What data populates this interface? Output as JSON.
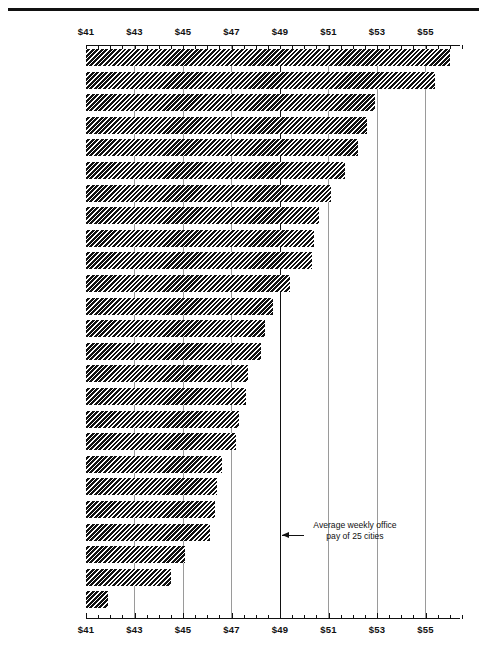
{
  "chart_data": {
    "type": "bar",
    "orientation": "horizontal",
    "title": "",
    "xlabel": "",
    "ylabel": "",
    "xlim": [
      41,
      56.5
    ],
    "grid": true,
    "tick_labels": [
      "$41",
      "$43",
      "$45",
      "$47",
      "$49",
      "$51",
      "$53",
      "$55"
    ],
    "tick_values": [
      41,
      43,
      45,
      47,
      49,
      51,
      53,
      55
    ],
    "categories": [
      "San Francisco",
      "Los Angeles",
      "New York City",
      "Cleveland",
      "Seattle",
      "Houston",
      "Pittsburgh",
      "Newark",
      "Indianapolis",
      "Rochester",
      "Buffalo",
      "St. Louis",
      "Kansas City",
      "Denver",
      "Hartford",
      "Norfolk",
      "Salt Lake City",
      "Philadelphia",
      "Richmond",
      "Minneapolis-\nSt. Paul",
      "Oklahoma City",
      "New Orleans",
      "Memphis",
      "Providence",
      "Scranton"
    ],
    "values": [
      56.0,
      55.4,
      52.9,
      52.6,
      52.2,
      51.7,
      51.1,
      50.6,
      50.4,
      50.3,
      49.4,
      48.7,
      48.4,
      48.2,
      47.7,
      47.6,
      47.3,
      47.2,
      46.6,
      46.4,
      46.3,
      46.1,
      45.1,
      44.5,
      41.9
    ],
    "annotations": [
      {
        "name": "average-line",
        "value": 49.0,
        "text": "Average weekly office\npay of 25 cities"
      }
    ]
  },
  "axis": {
    "top_labels": [
      "$41",
      "$43",
      "$45",
      "$47",
      "$49",
      "$51",
      "$53",
      "$55"
    ],
    "bottom_labels": [
      "$41",
      "$43",
      "$45",
      "$47",
      "$49",
      "$51",
      "$53",
      "$55"
    ]
  },
  "annotation": {
    "text": "Average weekly office\npay of 25 cities"
  }
}
